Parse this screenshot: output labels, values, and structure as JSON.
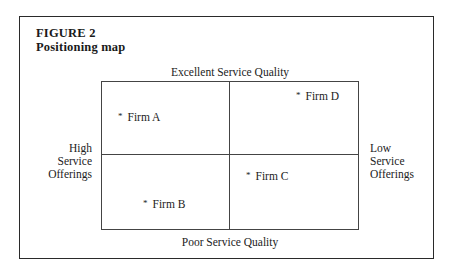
{
  "figure": {
    "label": "FIGURE 2",
    "title": "Positioning map"
  },
  "axes": {
    "top": "Excellent Service Quality",
    "bottom": "Poor Service Quality",
    "left": [
      "High",
      "Service",
      "Offerings"
    ],
    "right": [
      "Low",
      "Service",
      "Offerings"
    ]
  },
  "firms": [
    {
      "marker": "*",
      "name": "Firm A",
      "quadrant": "top-left"
    },
    {
      "marker": "*",
      "name": "Firm B",
      "quadrant": "bottom-left"
    },
    {
      "marker": "*",
      "name": "Firm C",
      "quadrant": "bottom-right"
    },
    {
      "marker": "*",
      "name": "Firm D",
      "quadrant": "top-right"
    }
  ]
}
